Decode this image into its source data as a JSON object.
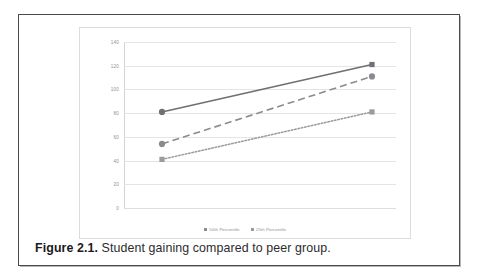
{
  "figure": {
    "caption_number": "Figure 2.1.",
    "caption_text": " Student gaining compared to peer group."
  },
  "chart_data": {
    "type": "line",
    "title": "",
    "xlabel": "",
    "ylabel": "",
    "ylim": [
      0,
      140
    ],
    "yticks": [
      140,
      120,
      100,
      80,
      60,
      40,
      20,
      0
    ],
    "ytick_labels": [
      "140",
      "120",
      "100",
      "80",
      "60",
      "40",
      "20",
      "0"
    ],
    "grid": true,
    "x": [
      1,
      2
    ],
    "xtick_labels": [
      "",
      ""
    ],
    "legend_position": "bottom-center",
    "legend_entries": [
      "50th Percentile",
      "25th Percentile"
    ],
    "series": [
      {
        "name": "Goal line",
        "values": [
          81,
          121
        ],
        "style": "solid",
        "color": "#6f6f75",
        "markers": [
          "circle",
          "square"
        ],
        "in_legend": false
      },
      {
        "name": "50th Percentile",
        "values": [
          54,
          111
        ],
        "style": "dashed",
        "color": "#8a8a90",
        "markers": [
          "circle",
          "circle"
        ],
        "in_legend": true
      },
      {
        "name": "25th Percentile",
        "values": [
          41,
          81
        ],
        "style": "dotted",
        "color": "#9a9aa0",
        "markers": [
          "square",
          "square"
        ],
        "in_legend": true
      }
    ]
  },
  "colors": {
    "frame_border": "#4a4a4d",
    "chart_border": "#dcdcdf",
    "gridline": "#e4e4e7",
    "axis_text": "#8f8f93",
    "caption_text": "#2b2b2e"
  }
}
